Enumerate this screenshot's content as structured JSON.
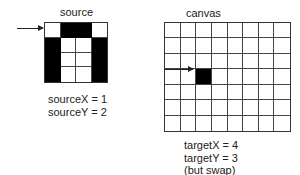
{
  "source": {
    "title": "source",
    "cols": 4,
    "rows": 4,
    "cells": [
      [
        0,
        1,
        1,
        0
      ],
      [
        1,
        0,
        0,
        1
      ],
      [
        1,
        0,
        0,
        1
      ],
      [
        1,
        0,
        0,
        1
      ]
    ],
    "arrow_row": 0,
    "vars": [
      "sourceX = 1",
      "sourceY = 2"
    ]
  },
  "canvas": {
    "title": "canvas",
    "cols": 8,
    "rows": 7,
    "filled_cell": {
      "col": 2,
      "row": 3
    },
    "arrow_row": 3,
    "vars": [
      "targetX = 4",
      "targetY = 3",
      "(but swap)"
    ]
  },
  "colors": {
    "fill": "#000000",
    "line": "#444444",
    "background": "#ffffff"
  }
}
